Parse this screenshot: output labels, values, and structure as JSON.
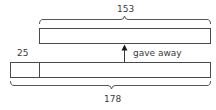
{
  "diagram": {
    "type": "bar-model",
    "top_bar": {
      "total_label": "153"
    },
    "bottom_bar": {
      "part_label": "25",
      "total_label": "178"
    },
    "arrow_label": "gave away",
    "colors": {
      "line": "#4a4a4a",
      "fill": "#ffffff"
    }
  }
}
